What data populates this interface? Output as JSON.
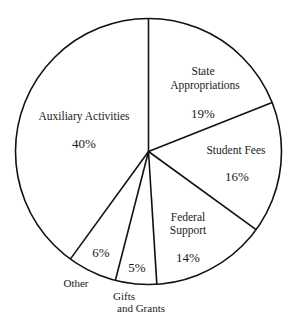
{
  "chart_data": {
    "type": "pie",
    "title": "",
    "start_angle_deg": 0,
    "direction": "clockwise",
    "slices": [
      {
        "label": "State Appropriations",
        "value": 19,
        "display": "19%"
      },
      {
        "label": "Student Fees",
        "value": 16,
        "display": "16%"
      },
      {
        "label": "Federal Support",
        "value": 14,
        "display": "14%"
      },
      {
        "label": "Gifts and Grants",
        "value": 5,
        "display": "5%"
      },
      {
        "label": "Other",
        "value": 6,
        "display": "6%"
      },
      {
        "label": "Auxiliary Activities",
        "value": 40,
        "display": "40%"
      }
    ],
    "categories": [
      "State Appropriations",
      "Student Fees",
      "Federal Support",
      "Gifts and Grants",
      "Other",
      "Auxiliary Activities"
    ],
    "values": [
      19,
      16,
      14,
      5,
      6,
      40
    ],
    "unit": "%",
    "legend": "none (labels placed in/near slices)",
    "colors": {
      "fill": "#ffffff",
      "stroke": "#111111"
    }
  },
  "labels": {
    "state_line1": "State",
    "state_line2": "Appropriations",
    "state_pct": "19%",
    "student_line1": "Student Fees",
    "student_pct": "16%",
    "federal_line1": "Federal",
    "federal_line2": "Support",
    "federal_pct": "14%",
    "gifts_line1": "Gifts",
    "gifts_line2": "and Grants",
    "gifts_pct": "5%",
    "other_line1": "Other",
    "other_pct": "6%",
    "aux_line1": "Auxiliary Activities",
    "aux_pct": "40%"
  }
}
